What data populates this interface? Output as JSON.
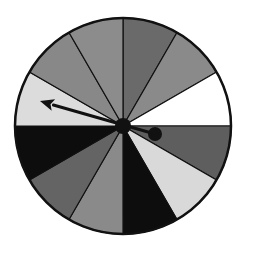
{
  "spinner": {
    "center": [
      123,
      126
    ],
    "radius": 108,
    "sector_count": 12,
    "sectors": [
      {
        "start_deg": -90,
        "end_deg": -60,
        "color": "#6a6a6a",
        "shade": "dark-gray"
      },
      {
        "start_deg": -60,
        "end_deg": -30,
        "color": "#8a8a8a",
        "shade": "medium-gray"
      },
      {
        "start_deg": -30,
        "end_deg": 0,
        "color": "#ffffff",
        "shade": "white"
      },
      {
        "start_deg": 0,
        "end_deg": 30,
        "color": "#5e5e5e",
        "shade": "dark-gray"
      },
      {
        "start_deg": 30,
        "end_deg": 60,
        "color": "#d9d9d9",
        "shade": "light-gray"
      },
      {
        "start_deg": 60,
        "end_deg": 90,
        "color": "#0d0d0d",
        "shade": "black"
      },
      {
        "start_deg": 90,
        "end_deg": 120,
        "color": "#8a8a8a",
        "shade": "medium-gray"
      },
      {
        "start_deg": 120,
        "end_deg": 150,
        "color": "#646464",
        "shade": "dark-gray"
      },
      {
        "start_deg": 150,
        "end_deg": 180,
        "color": "#0d0d0d",
        "shade": "black"
      },
      {
        "start_deg": 180,
        "end_deg": 210,
        "color": "#dcdcdc",
        "shade": "light-gray"
      },
      {
        "start_deg": 210,
        "end_deg": 240,
        "color": "#888888",
        "shade": "medium-gray"
      },
      {
        "start_deg": 240,
        "end_deg": 270,
        "color": "#8c8c8c",
        "shade": "medium-gray"
      }
    ],
    "pointer": {
      "tip": [
        40,
        101
      ],
      "tail_ball": [
        155,
        134
      ],
      "tail_ball_radius": 7,
      "hub_radius": 8,
      "color": "#111111",
      "points_to_sector_shade": "light-gray"
    },
    "outline_color": "#111111"
  }
}
